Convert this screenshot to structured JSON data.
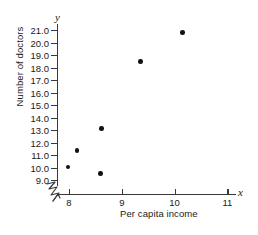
{
  "chart_data": {
    "type": "scatter",
    "title": "",
    "xlabel": "Per capita income",
    "ylabel": "Number of doctors",
    "x_letter": "x",
    "y_letter": "y",
    "xlim": [
      7.72,
      11.3
    ],
    "ylim": [
      8.6,
      21.45
    ],
    "grid": false,
    "legend": null,
    "x_ticks": [
      8,
      9,
      10,
      11
    ],
    "x_tick_labels": [
      "8",
      "9",
      "10",
      "11"
    ],
    "y_ticks": [
      9.0,
      10.0,
      11.0,
      12.0,
      13.0,
      14.0,
      15.0,
      16.0,
      17.0,
      18.0,
      19.0,
      20.0,
      21.0
    ],
    "y_tick_labels": [
      "9.0",
      "10.0",
      "11.0",
      "12.0",
      "13.0",
      "14.0",
      "15.0",
      "16.0",
      "17.0",
      "18.0",
      "19.0",
      "20.0",
      "21.0"
    ],
    "axis_break": {
      "axis": "x",
      "symbol": "zigzag",
      "note": "broken-axis mark between origin and first tick"
    },
    "marker": {
      "shape": "circle",
      "color": "#111111",
      "size_px": 4.6
    },
    "points": [
      {
        "x": 7.98,
        "y": 10.05
      },
      {
        "x": 8.15,
        "y": 11.35
      },
      {
        "x": 8.6,
        "y": 9.5
      },
      {
        "x": 8.62,
        "y": 13.1
      },
      {
        "x": 9.35,
        "y": 18.5
      },
      {
        "x": 10.15,
        "y": 20.8
      }
    ],
    "colors": {
      "axis": "#3a3a3a",
      "text": "#1a1a1a",
      "marker": "#111111",
      "background": "#ffffff"
    }
  }
}
